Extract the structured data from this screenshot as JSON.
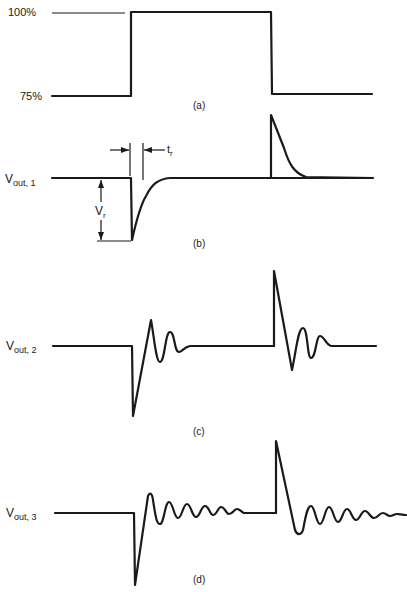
{
  "diagram": {
    "panels": [
      {
        "id": "a",
        "caption": "(a)",
        "y_labels": {
          "high": "100%",
          "low": "75%"
        },
        "description": "Step input: load steps from 75% to 100% then back to 75%"
      },
      {
        "id": "b",
        "caption": "(b)",
        "signal_label": {
          "main": "V",
          "sub": "out, 1"
        },
        "annotations": {
          "recovery_time": {
            "main": "t",
            "sub": "r"
          },
          "dip_voltage": {
            "main": "V",
            "sub": "r"
          }
        },
        "description": "Overdamped response: undershoot then exponential recovery; overshoot spike on load release"
      },
      {
        "id": "c",
        "caption": "(c)",
        "signal_label": {
          "main": "V",
          "sub": "out, 2"
        },
        "description": "Underdamped response with a few ringing cycles that settle"
      },
      {
        "id": "d",
        "caption": "(d)",
        "signal_label": {
          "main": "V",
          "sub": "out, 3"
        },
        "description": "Lightly damped response with sustained ringing"
      }
    ],
    "colors": {
      "ink": "#1a1a1a",
      "background": "#ffffff"
    }
  }
}
